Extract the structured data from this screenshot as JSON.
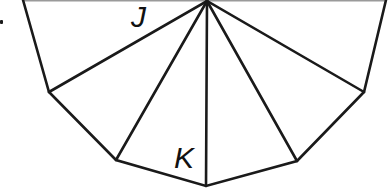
{
  "diagram": {
    "type": "fan-triangulated-polygon",
    "labels": {
      "J": "J",
      "K": "K"
    },
    "apex": [
      207,
      1
    ],
    "vertices": [
      [
        23,
        0
      ],
      [
        49,
        92
      ],
      [
        116,
        160
      ],
      [
        206,
        186
      ],
      [
        297,
        161
      ],
      [
        364,
        92
      ],
      [
        386,
        0
      ]
    ],
    "stroke_color": "#1a1a1a",
    "top_edge_color": "#9a9a9a"
  }
}
